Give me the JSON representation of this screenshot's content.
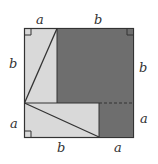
{
  "diagram": {
    "labels": {
      "top_left": "a",
      "top_right": "b",
      "left_upper": "b",
      "left_lower": "a",
      "right_upper": "b",
      "right_lower": "a",
      "bottom_left": "b",
      "bottom_right": "a"
    },
    "colors": {
      "light": "#d9d9d9",
      "dark": "#6e6e6e",
      "stroke": "#333333"
    }
  }
}
